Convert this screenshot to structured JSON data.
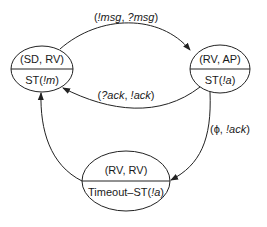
{
  "diagram": {
    "type": "state-transition",
    "nodes": [
      {
        "id": "sd_rv",
        "top": "(SD, RV)",
        "bottom_prefix": "ST(",
        "bottom_italic": "!m",
        "bottom_suffix": ")"
      },
      {
        "id": "rv_ap",
        "top": "(RV, AP)",
        "bottom_prefix": "ST(",
        "bottom_italic": "!a",
        "bottom_suffix": ")"
      },
      {
        "id": "rv_rv",
        "top": "(RV, RV)",
        "bottom_prefix": "Timeout–ST(",
        "bottom_italic": "!a",
        "bottom_suffix": ")"
      }
    ],
    "edges": [
      {
        "from": "sd_rv",
        "to": "rv_ap",
        "label_open": "(",
        "label_a": "!msg",
        "label_sep": ", ",
        "label_b": "?msg",
        "label_close": ")"
      },
      {
        "from": "rv_ap",
        "to": "sd_rv",
        "label_open": "(",
        "label_a": "?ack",
        "label_sep": ", ",
        "label_b": "!ack",
        "label_close": ")"
      },
      {
        "from": "rv_ap",
        "to": "rv_rv",
        "label_open": "(",
        "label_a": "ϕ",
        "label_sep": ", ",
        "label_b": "!ack",
        "label_close": ")"
      },
      {
        "from": "rv_rv",
        "to": "sd_rv",
        "label_open": "",
        "label_a": "",
        "label_sep": "",
        "label_b": "",
        "label_close": ""
      }
    ]
  }
}
